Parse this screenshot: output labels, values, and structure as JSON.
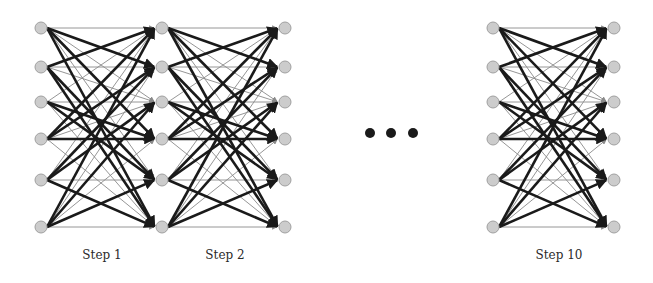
{
  "diagram": {
    "title": "",
    "node_style": {
      "fill": "#cccccc",
      "stroke": "#a0a0a0",
      "radius": 6
    },
    "edge_style": {
      "thick_color": "#1a1a1a",
      "thin_color": "#8a8a8a",
      "thick_width": 2.6,
      "thin_width": 0.9
    },
    "rows_y": [
      28,
      67,
      102,
      139,
      180,
      227
    ],
    "blocks": [
      {
        "label": "Step 1",
        "x_from": 41,
        "x_to": 162,
        "label_x": 102,
        "label_y": 248
      },
      {
        "label": "Step 2",
        "x_from": 162,
        "x_to": 285,
        "label_x": 225,
        "label_y": 248
      },
      {
        "label": "Step 10",
        "x_from": 493,
        "x_to": 614,
        "label_x": 559,
        "label_y": 248
      }
    ],
    "ellipsis": {
      "dots_x": [
        370,
        391,
        413
      ],
      "y": 133,
      "radius": 5,
      "color": "#1a1a1a"
    },
    "edges": [
      {
        "from": 0,
        "to": 0,
        "w": "thin"
      },
      {
        "from": 0,
        "to": 1,
        "w": "thick"
      },
      {
        "from": 0,
        "to": 2,
        "w": "thin"
      },
      {
        "from": 0,
        "to": 3,
        "w": "thick"
      },
      {
        "from": 0,
        "to": 4,
        "w": "thin"
      },
      {
        "from": 0,
        "to": 5,
        "w": "thick"
      },
      {
        "from": 1,
        "to": 0,
        "w": "thick"
      },
      {
        "from": 1,
        "to": 1,
        "w": "thin"
      },
      {
        "from": 1,
        "to": 2,
        "w": "thin"
      },
      {
        "from": 1,
        "to": 4,
        "w": "thick"
      },
      {
        "from": 1,
        "to": 5,
        "w": "thick"
      },
      {
        "from": 2,
        "to": 2,
        "w": "thin"
      },
      {
        "from": 2,
        "to": 3,
        "w": "thick"
      },
      {
        "from": 2,
        "to": 4,
        "w": "thick"
      },
      {
        "from": 2,
        "to": 5,
        "w": "thin"
      },
      {
        "from": 2,
        "to": 0,
        "w": "thin"
      },
      {
        "from": 3,
        "to": 0,
        "w": "thick"
      },
      {
        "from": 3,
        "to": 1,
        "w": "thick"
      },
      {
        "from": 3,
        "to": 3,
        "w": "thick"
      },
      {
        "from": 3,
        "to": 2,
        "w": "thin"
      },
      {
        "from": 3,
        "to": 5,
        "w": "thin"
      },
      {
        "from": 4,
        "to": 1,
        "w": "thick"
      },
      {
        "from": 4,
        "to": 2,
        "w": "thick"
      },
      {
        "from": 4,
        "to": 4,
        "w": "thin"
      },
      {
        "from": 4,
        "to": 5,
        "w": "thick"
      },
      {
        "from": 4,
        "to": 0,
        "w": "thin"
      },
      {
        "from": 5,
        "to": 0,
        "w": "thick"
      },
      {
        "from": 5,
        "to": 2,
        "w": "thick"
      },
      {
        "from": 5,
        "to": 3,
        "w": "thin"
      },
      {
        "from": 5,
        "to": 4,
        "w": "thick"
      },
      {
        "from": 5,
        "to": 5,
        "w": "thin"
      },
      {
        "from": 5,
        "to": 1,
        "w": "thin"
      }
    ]
  }
}
